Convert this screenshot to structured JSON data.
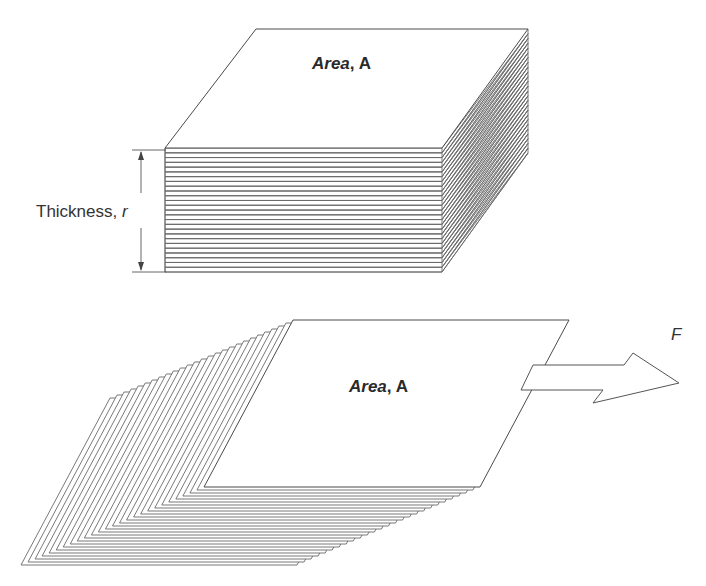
{
  "figure": {
    "top_block": {
      "area_label_italic": "Area",
      "area_label_rest": ", A",
      "thickness_label": "Thickness, ",
      "thickness_symbol": "r",
      "sheet_count": 26
    },
    "bottom_block": {
      "area_label_italic": "Area",
      "area_label_rest": ", A",
      "sheet_count": 26
    },
    "force": {
      "label": "F"
    }
  },
  "colors": {
    "line": "#555555",
    "text": "#2a2a2a",
    "background": "#ffffff"
  }
}
